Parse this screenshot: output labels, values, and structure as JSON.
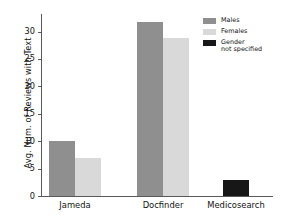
{
  "chart_data": {
    "type": "bar",
    "title": "",
    "subtitle": "",
    "xlabel": "",
    "ylabel": "Avg. Num. of Reviews with Text",
    "categories": [
      "Jameda",
      "Docfinder",
      "Medicosearch"
    ],
    "series": [
      {
        "name": "Males",
        "color": "#8f8f8f",
        "values": [
          10.0,
          31.8,
          null
        ]
      },
      {
        "name": "Females",
        "color": "#d9d9d9",
        "values": [
          6.9,
          28.9,
          null
        ]
      },
      {
        "name": "Gender\nnot specified",
        "color": "#171717",
        "values": [
          null,
          null,
          2.9
        ]
      }
    ],
    "ylim": [
      0,
      33.2
    ],
    "yticks": [
      0,
      5,
      10,
      15,
      20,
      25,
      30
    ],
    "ytick_labels": [
      "0",
      "5",
      "10",
      "15",
      "20",
      "25",
      "30"
    ],
    "grid": false,
    "legend_position": "top-right",
    "legend_entries": [
      "Males",
      "Females",
      "Gender\nnot specified"
    ],
    "annotations": []
  },
  "axes": {
    "spine_color": "#5a5a5a",
    "background": "#ffffff"
  }
}
